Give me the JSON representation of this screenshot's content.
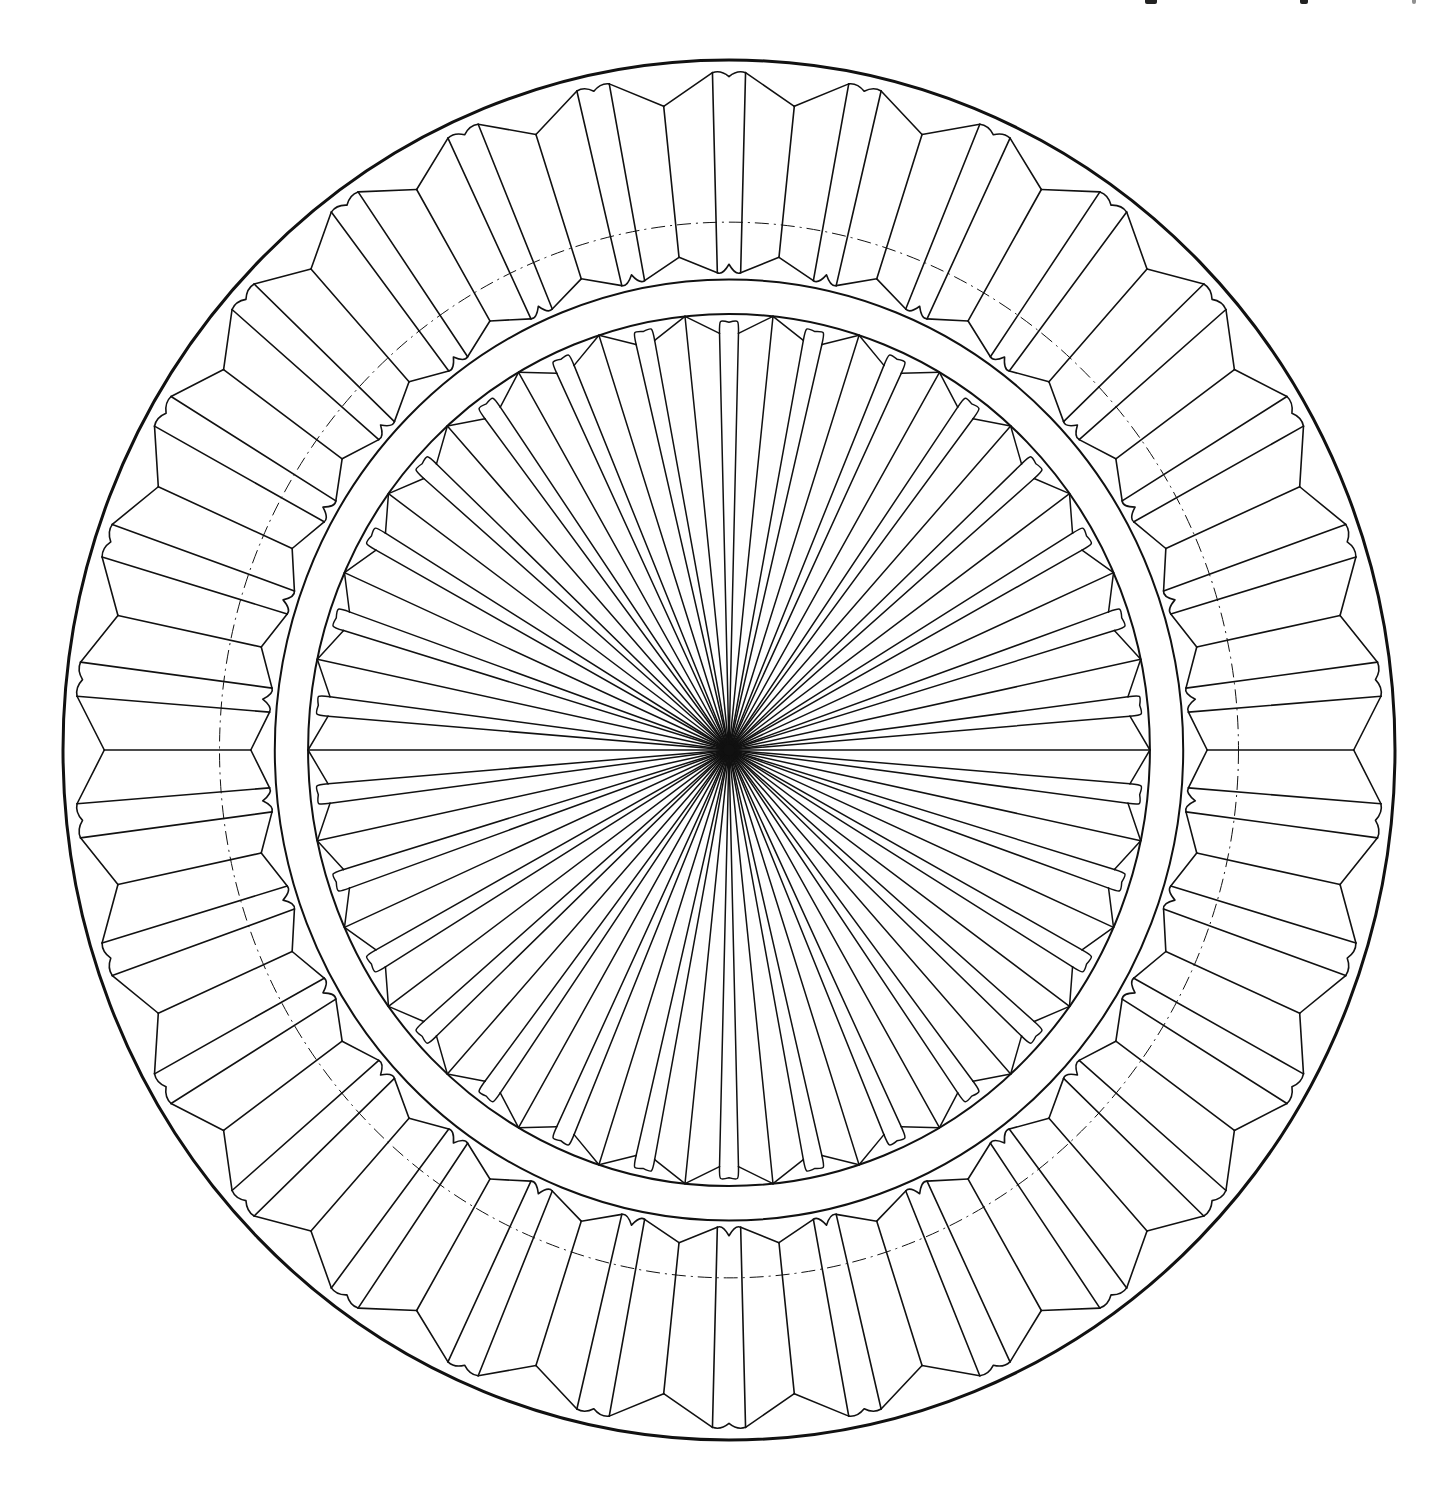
{
  "figure": {
    "title": "",
    "canvas": {
      "width": 1449,
      "height": 1495,
      "background": "#ffffff"
    },
    "ink_color": "#111111",
    "center": {
      "x": 729,
      "y": 750
    },
    "radius": {
      "rx": 666,
      "ry": 690
    },
    "outer_rim": {
      "r": 1.0,
      "stroke_width": 3
    },
    "outer_ring": {
      "units": 30,
      "start_angle_deg": 0,
      "flute_half_angle_deg": 1.45,
      "flute_outer_r": 0.982,
      "flute_inner_r": 0.692,
      "panel_outer_vertex_r": 0.938,
      "panel_inner_vertex_r": 0.718,
      "stroke_width": 1.6
    },
    "guide_circle": {
      "r": 0.765,
      "stroke_width": 1,
      "dash": "14 5 2 5"
    },
    "band": {
      "outer_r": 0.682,
      "inner_r": 0.632,
      "stroke_width": 2
    },
    "inner_rosette": {
      "units": 30,
      "lobe_start_angle_deg": 0,
      "vertex_r": 0.632,
      "lobe_side_top_r": 0.604,
      "lobe_cap_r": 0.62,
      "lobe_half_angle_deg": 1.35,
      "hub_r": 0.004,
      "stroke_width": 1.5
    },
    "header_fragment": {
      "note": "partially cropped text line at top-right edge (illegible)",
      "marks": [
        1148,
        1301,
        1415
      ]
    }
  }
}
